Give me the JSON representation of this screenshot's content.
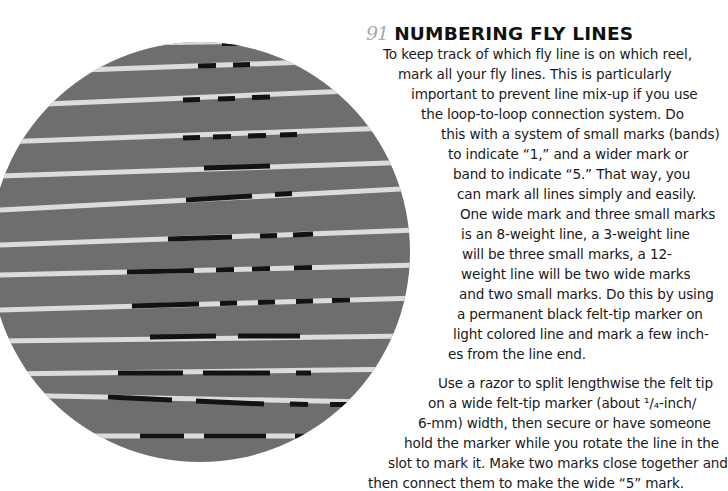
{
  "article": {
    "number": "91",
    "title": "NUMBERING FLY LINES",
    "paragraph1_lines": [
      "To keep track of which fly line is on which reel,",
      "mark all your fly lines. This is particularly",
      "important to prevent line mix-up if you use",
      "the loop-to-loop connection system. Do",
      "this with a system of small marks (bands)",
      "to indicate “1,” and a wider mark or",
      "band to indicate “5.” That way, you",
      "can mark all lines simply and easily.",
      "One wide mark and three small marks",
      "is an 8-weight line, a 3-weight line",
      "will be three small marks, a 12-",
      "weight line will be two wide marks",
      "and two small marks. Do this by using",
      "a permanent black felt-tip marker on",
      "light colored line and mark a few inch-",
      "es from the line end."
    ],
    "paragraph2_lines": [
      "Use a razor to split lengthwise the felt tip",
      "on a wide felt-tip marker (about ¹/₄-inch/",
      "6-mm) width, then secure or have someone",
      "hold the marker while you rotate the line in the",
      "slot to mark it. Make two marks close together and",
      "then connect them to make the wide “5” mark."
    ]
  },
  "photo": {
    "description": "Circular photo of marked fly lines on gray background",
    "colors": {
      "background": "#707070",
      "line": "#dcdcdc",
      "mark": "#121212"
    }
  }
}
